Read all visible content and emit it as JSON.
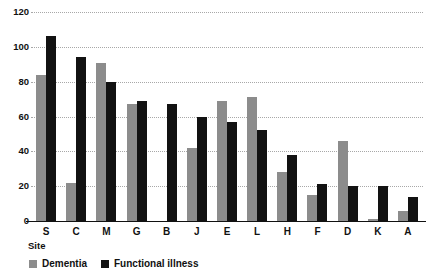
{
  "chart_data": {
    "type": "bar",
    "title": "",
    "xlabel": "Site",
    "ylabel": "",
    "ylim": [
      0,
      120
    ],
    "yticks": [
      0,
      20,
      40,
      60,
      80,
      100,
      120
    ],
    "grid": true,
    "legend_position": "bottom-left",
    "categories": [
      "S",
      "C",
      "M",
      "G",
      "B",
      "J",
      "E",
      "L",
      "H",
      "F",
      "D",
      "K",
      "A"
    ],
    "series": [
      {
        "name": "Dementia",
        "color": "#8c8c8c",
        "values": [
          84,
          22,
          91,
          67,
          0,
          42,
          69,
          71,
          28,
          15,
          46,
          1,
          6
        ]
      },
      {
        "name": "Functional illness",
        "color": "#121212",
        "values": [
          106,
          94,
          80,
          69,
          67,
          60,
          57,
          52,
          38,
          21,
          20,
          20,
          14
        ]
      }
    ]
  },
  "axis": {
    "x_title": "Site"
  },
  "legend": {
    "items": [
      {
        "label": "Dementia",
        "color": "#8c8c8c",
        "swatch": "legend-swatch-gray"
      },
      {
        "label": "Functional illness",
        "color": "#121212",
        "swatch": "legend-swatch-black"
      }
    ]
  }
}
